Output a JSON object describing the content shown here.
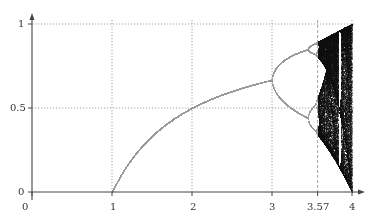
{
  "chart_data": {
    "type": "scatter",
    "title": "",
    "xlabel": "",
    "ylabel": "",
    "xlim": [
      0,
      4
    ],
    "ylim": [
      0,
      1
    ],
    "grid": "dotted at labelled ticks",
    "x_ticks": [
      {
        "value": 0,
        "label": "0",
        "gridline": false
      },
      {
        "value": 1,
        "label": "1",
        "gridline": "dotted"
      },
      {
        "value": 2,
        "label": "2",
        "gridline": "dotted"
      },
      {
        "value": 3,
        "label": "3",
        "gridline": "dotted"
      },
      {
        "value": 3.57,
        "label": "3.57",
        "gridline": "dashed"
      },
      {
        "value": 4,
        "label": "4",
        "gridline": "dotted"
      }
    ],
    "y_ticks": [
      {
        "value": 0,
        "label": "0"
      },
      {
        "value": 0.5,
        "label": "0.5"
      },
      {
        "value": 1,
        "label": "1"
      }
    ],
    "series": [
      {
        "name": "stable fixed point 0",
        "x_range": [
          0,
          1
        ],
        "values": "x = 0"
      },
      {
        "name": "stable fixed point 1-1/r",
        "x_range": [
          1,
          3
        ],
        "sample_points": [
          [
            1,
            0
          ],
          [
            2,
            0.5
          ],
          [
            3,
            0.667
          ]
        ]
      },
      {
        "name": "period-doubling cascade",
        "x_range": [
          3,
          3.57
        ],
        "sample_points": [
          [
            3.2,
            0.513
          ],
          [
            3.2,
            0.799
          ],
          [
            3.5,
            0.383
          ],
          [
            3.5,
            0.827
          ],
          [
            3.5,
            0.501
          ],
          [
            3.5,
            0.875
          ]
        ]
      },
      {
        "name": "chaotic region",
        "x_range": [
          3.57,
          4
        ],
        "values": "dense scatter, envelope up to r/4, lower bound tends to 0 at r=4"
      }
    ],
    "annotations": [
      "3.57 marks onset of chaos (Feigenbaum point)"
    ],
    "legend": null
  },
  "render": {
    "plot_left_px": 32,
    "plot_right_px": 352,
    "plot_top_px": 24,
    "plot_bottom_px": 192,
    "r_start": 0.0,
    "r_step_px": 0.5,
    "transient_iters": 400,
    "plot_iters": 160,
    "colors": {
      "axis": "#444444",
      "grid": "#8a8a8a",
      "curve": "#9a9a9a",
      "chaos": "#111111",
      "label": "#333333"
    }
  }
}
